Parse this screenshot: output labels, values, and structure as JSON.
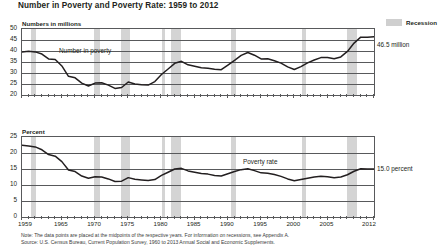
{
  "title": "Number in Poverty and Poverty Rate: 1959 to 2012",
  "legend": {
    "recession_label": "Recession",
    "recession_color": "#d4d4d4"
  },
  "series_color": "#231f20",
  "notes": {
    "line1": "Note: The data points are placed at the midpoints of the respective years. For information on recessions, see Appendix A.",
    "line2": "Source: U.S. Census Bureau, Current Population Survey, 1960 to 2013 Annual Social and Economic Supplements."
  },
  "chart_data": [
    {
      "type": "line",
      "id": "number-in-poverty",
      "title": "Number in Poverty and Poverty Rate: 1959 to 2012",
      "ylabel": "Numbers in millions",
      "xlabel": "",
      "series_label": "Number in poverty",
      "end_annotation": "46.5 million",
      "ylim": [
        20,
        50
      ],
      "yticks": [
        50,
        45,
        40,
        35,
        30,
        25,
        20
      ],
      "xlim": [
        1959,
        2012
      ],
      "xticks": [
        1959,
        1965,
        1970,
        1975,
        1980,
        1985,
        1990,
        1995,
        2000,
        2005,
        2012
      ],
      "grid": true,
      "legend_position": "top-right",
      "x": [
        1959,
        1960,
        1961,
        1962,
        1963,
        1964,
        1965,
        1966,
        1967,
        1968,
        1969,
        1970,
        1971,
        1972,
        1973,
        1974,
        1975,
        1976,
        1977,
        1978,
        1979,
        1980,
        1981,
        1982,
        1983,
        1984,
        1985,
        1986,
        1987,
        1988,
        1989,
        1990,
        1991,
        1992,
        1993,
        1994,
        1995,
        1996,
        1997,
        1998,
        1999,
        2000,
        2001,
        2002,
        2003,
        2004,
        2005,
        2006,
        2007,
        2008,
        2009,
        2010,
        2011,
        2012
      ],
      "values": [
        39.5,
        39.9,
        39.6,
        38.6,
        36.4,
        36.1,
        33.2,
        28.5,
        27.8,
        25.4,
        24.1,
        25.4,
        25.6,
        24.5,
        23.0,
        23.4,
        25.9,
        25.0,
        24.7,
        24.5,
        26.1,
        29.3,
        31.8,
        34.4,
        35.3,
        33.7,
        33.1,
        32.4,
        32.2,
        31.7,
        31.5,
        33.6,
        35.7,
        38.0,
        39.3,
        38.1,
        36.4,
        36.5,
        35.6,
        34.5,
        32.8,
        31.6,
        32.9,
        34.6,
        35.9,
        37.0,
        37.0,
        36.5,
        37.3,
        39.8,
        43.6,
        46.3,
        46.2,
        46.5
      ]
    },
    {
      "type": "line",
      "id": "poverty-rate",
      "ylabel": "Percent",
      "xlabel": "",
      "series_label": "Poverty rate",
      "end_annotation": "15.0 percent",
      "ylim": [
        0,
        25
      ],
      "yticks": [
        25,
        20,
        15,
        10,
        5,
        0
      ],
      "xlim": [
        1959,
        2012
      ],
      "xticks": [
        1959,
        1965,
        1970,
        1975,
        1980,
        1985,
        1990,
        1995,
        2000,
        2005,
        2012
      ],
      "grid": true,
      "x": [
        1959,
        1960,
        1961,
        1962,
        1963,
        1964,
        1965,
        1966,
        1967,
        1968,
        1969,
        1970,
        1971,
        1972,
        1973,
        1974,
        1975,
        1976,
        1977,
        1978,
        1979,
        1980,
        1981,
        1982,
        1983,
        1984,
        1985,
        1986,
        1987,
        1988,
        1989,
        1990,
        1991,
        1992,
        1993,
        1994,
        1995,
        1996,
        1997,
        1998,
        1999,
        2000,
        2001,
        2002,
        2003,
        2004,
        2005,
        2006,
        2007,
        2008,
        2009,
        2010,
        2011,
        2012
      ],
      "values": [
        22.4,
        22.2,
        21.9,
        21.0,
        19.5,
        19.0,
        17.3,
        14.7,
        14.2,
        12.8,
        12.1,
        12.6,
        12.5,
        11.9,
        11.1,
        11.2,
        12.3,
        11.8,
        11.6,
        11.4,
        11.7,
        13.0,
        14.0,
        15.0,
        15.2,
        14.4,
        14.0,
        13.6,
        13.4,
        13.0,
        12.8,
        13.5,
        14.2,
        14.8,
        15.1,
        14.5,
        13.8,
        13.7,
        13.3,
        12.7,
        11.9,
        11.3,
        11.7,
        12.1,
        12.5,
        12.7,
        12.6,
        12.3,
        12.5,
        13.2,
        14.3,
        15.1,
        15.0,
        15.0
      ]
    }
  ],
  "recessions": [
    {
      "start": 1960.3,
      "end": 1961.1
    },
    {
      "start": 1969.9,
      "end": 1970.8
    },
    {
      "start": 1973.9,
      "end": 1975.2
    },
    {
      "start": 1980.1,
      "end": 1980.5
    },
    {
      "start": 1981.5,
      "end": 1982.9
    },
    {
      "start": 1990.5,
      "end": 1991.2
    },
    {
      "start": 2001.2,
      "end": 2001.8
    },
    {
      "start": 2007.9,
      "end": 2009.4
    }
  ]
}
